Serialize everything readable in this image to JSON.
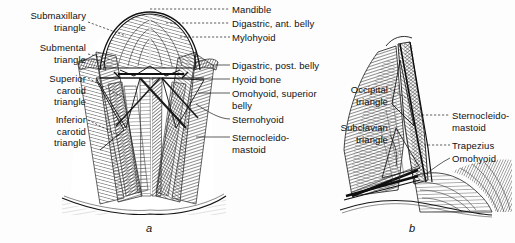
{
  "figure": {
    "caption_a": "a",
    "caption_b": "b",
    "style": "pen-and-ink anatomical engraving",
    "ink_color": "#1a1a1a",
    "background_color": "#fdfdfd"
  },
  "panel_a": {
    "name": "anterior-neck-triangles",
    "labels_left": [
      {
        "id": "submaxillary-triangle",
        "text": "Submaxillary\ntriangle",
        "x": 2,
        "y": 10,
        "width": 84
      },
      {
        "id": "submental-triangle",
        "text": "Submental\ntriangle",
        "x": 2,
        "y": 42,
        "width": 84
      },
      {
        "id": "superior-carotid-triangle",
        "text": "Superior\ncarotid\ntriangle",
        "x": 2,
        "y": 73,
        "width": 84
      },
      {
        "id": "inferior-carotid-triangle",
        "text": "Inferior\ncarotid\ntriangle",
        "x": 2,
        "y": 114,
        "width": 84
      }
    ],
    "labels_right": [
      {
        "id": "mandible",
        "text": "Mandible",
        "x": 232,
        "y": 4
      },
      {
        "id": "digastric-ant-belly",
        "text": "Digastric, ant. belly",
        "x": 232,
        "y": 18
      },
      {
        "id": "mylohyoid",
        "text": "Mylohyoid",
        "x": 232,
        "y": 32
      },
      {
        "id": "digastric-post-belly",
        "text": "Digastric, post. belly",
        "x": 232,
        "y": 60
      },
      {
        "id": "hyoid-bone",
        "text": "Hyoid bone",
        "x": 232,
        "y": 74
      },
      {
        "id": "omohyoid-superior-belly",
        "text": "Omohyoid, superior\nbelly",
        "x": 232,
        "y": 88
      },
      {
        "id": "sternohyoid",
        "text": "Sternohyoid",
        "x": 232,
        "y": 114
      },
      {
        "id": "sternocleidomastoid",
        "text": "Sternocleido-\nmastoid",
        "x": 232,
        "y": 132
      }
    ]
  },
  "panel_b": {
    "name": "posterior-neck-triangles",
    "labels_left": [
      {
        "id": "occipital-triangle",
        "text": "Occipital\ntriangle",
        "x": 322,
        "y": 84,
        "width": 66
      },
      {
        "id": "subclavian-triangle",
        "text": "Subclavian\ntriangle",
        "x": 302,
        "y": 122,
        "width": 86
      }
    ],
    "labels_right": [
      {
        "id": "sternocleidomastoid-b",
        "text": "Sternocleido-\nmastoid",
        "x": 452,
        "y": 110
      },
      {
        "id": "trapezius",
        "text": "Trapezius",
        "x": 452,
        "y": 140
      },
      {
        "id": "omohyoid-b",
        "text": "Omohyoid",
        "x": 452,
        "y": 153
      }
    ]
  },
  "captions": {
    "a": {
      "text": "a",
      "x": 146,
      "y": 222
    },
    "b": {
      "text": "b",
      "x": 409,
      "y": 222
    }
  }
}
